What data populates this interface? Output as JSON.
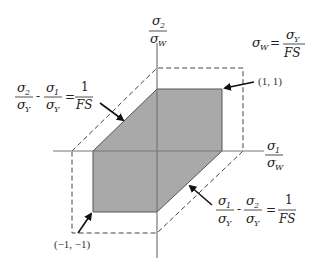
{
  "diagram": {
    "colors": {
      "region_fill": "#a9a9a9",
      "region_stroke": "#555555",
      "axis": "#777777",
      "dashed": "#444444",
      "arrow": "#111111",
      "text": "#222222"
    },
    "axes": {
      "x": {
        "numerator": "σ",
        "numerator_sub": "1",
        "denominator": "σ",
        "denominator_sub": "W"
      },
      "y": {
        "numerator": "σ",
        "numerator_sub": "2",
        "denominator": "σ",
        "denominator_sub": "W"
      }
    },
    "labels": {
      "definition": {
        "lhs": "σ",
        "lhs_sub": "W",
        "eq": "=",
        "rhs_num": "σ",
        "rhs_num_sub": "Y",
        "rhs_den": "FS"
      },
      "upper_left_line": {
        "t1_num": "σ",
        "t1_num_sub": "2",
        "t1_den": "σ",
        "t1_den_sub": "Y",
        "minus": "-",
        "t2_num": "σ",
        "t2_num_sub": "1",
        "t2_den": "σ",
        "t2_den_sub": "Y",
        "eq": "=",
        "rhs_num": "1",
        "rhs_den": "FS"
      },
      "lower_right_line": {
        "t1_num": "σ",
        "t1_num_sub": "1",
        "t1_den": "σ",
        "t1_den_sub": "Y",
        "minus": "-",
        "t2_num": "σ",
        "t2_num_sub": "2",
        "t2_den": "σ",
        "t2_den_sub": "Y",
        "eq": "=",
        "rhs_num": "1",
        "rhs_den": "FS"
      },
      "point_upper_right": "(1, 1)",
      "point_lower_left": "(−1, −1)"
    }
  }
}
